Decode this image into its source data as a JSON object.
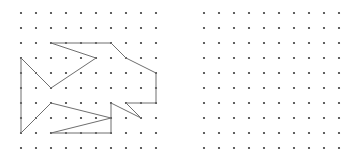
{
  "figure": {
    "width": 357,
    "height": 154,
    "background_color": "#ffffff"
  },
  "grid": {
    "rows": 10,
    "cols": 10,
    "spacing": 15,
    "dot_radius": 1.1,
    "dot_color": "#3a3a3a",
    "left_origin_x": 21,
    "left_origin_y": 13,
    "right_origin_x": 204,
    "right_origin_y": 13
  },
  "panels": [
    {
      "name": "left-panel",
      "label": "Panel with traced polygon",
      "has_polygon": true
    },
    {
      "name": "right-panel",
      "label": "Empty dot grid panel",
      "has_polygon": false
    }
  ],
  "chart_data": {
    "type": "scatter",
    "xlabel": "",
    "ylabel": "",
    "grid": true,
    "legend_position": "none",
    "series": [
      {
        "name": "left-dot-grid",
        "type": "scatter",
        "x": [
          0,
          1,
          2,
          3,
          4,
          5,
          6,
          7,
          8,
          9
        ],
        "y": [
          0,
          1,
          2,
          3,
          4,
          5,
          6,
          7,
          8,
          9
        ],
        "note": "10 by 10 lattice of points, spacing 15 px"
      },
      {
        "name": "right-dot-grid",
        "type": "scatter",
        "x": [
          0,
          1,
          2,
          3,
          4,
          5,
          6,
          7,
          8,
          9
        ],
        "y": [
          0,
          1,
          2,
          3,
          4,
          5,
          6,
          7,
          8,
          9
        ],
        "note": "10 by 10 lattice of points, spacing 15 px, no polygon"
      },
      {
        "name": "polygon-outline",
        "type": "line",
        "closed": true,
        "stroke_color": "#6e6e6e",
        "stroke_width": 1,
        "points_px": [
          [
            51,
            43
          ],
          [
            111,
            43
          ],
          [
            126,
            58
          ],
          [
            156,
            73
          ],
          [
            156,
            103
          ],
          [
            126,
            103
          ],
          [
            141,
            118
          ],
          [
            111,
            103
          ],
          [
            111,
            133
          ],
          [
            51,
            133
          ],
          [
            111,
            118
          ],
          [
            51,
            103
          ],
          [
            21,
            133
          ],
          [
            21,
            58
          ],
          [
            51,
            88
          ],
          [
            96,
            58
          ]
        ],
        "points_grid": [
          [
            2,
            2
          ],
          [
            6,
            2
          ],
          [
            7,
            3
          ],
          [
            9,
            4
          ],
          [
            9,
            6
          ],
          [
            7,
            6
          ],
          [
            8,
            7
          ],
          [
            6,
            6
          ],
          [
            6,
            8
          ],
          [
            2,
            8
          ],
          [
            6,
            7
          ],
          [
            2,
            6
          ],
          [
            0,
            8
          ],
          [
            0,
            3
          ],
          [
            2,
            5
          ],
          [
            5,
            3
          ]
        ]
      }
    ],
    "xlim": [
      0,
      9
    ],
    "ylim": [
      0,
      9
    ]
  },
  "polygon": {
    "vertex_count": 16,
    "stroke_color": "#6e6e6e",
    "path": "M 51 43 L 111 43 L 126 58 L 156 73 L 156 103 L 126 103 L 141 118 L 111 103 L 111 133 L 51 133 L 111 118 L 51 103 L 21 133 L 21 58 L 51 88 L 96 58 Z"
  }
}
